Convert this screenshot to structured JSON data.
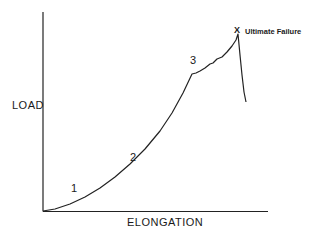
{
  "chart_data": {
    "type": "line",
    "title": "",
    "xlabel": "ELONGATION",
    "ylabel": "LOAD",
    "grid": false,
    "legend": null,
    "axis_ticks": "none",
    "series": [
      {
        "name": "Load-elongation curve",
        "points_px": [
          [
            43,
            211
          ],
          [
            55,
            209
          ],
          [
            70,
            204
          ],
          [
            85,
            197
          ],
          [
            100,
            188
          ],
          [
            115,
            177
          ],
          [
            130,
            164
          ],
          [
            145,
            149
          ],
          [
            160,
            131
          ],
          [
            172,
            113
          ],
          [
            183,
            93
          ],
          [
            192,
            74
          ],
          [
            196,
            73
          ],
          [
            200,
            71
          ],
          [
            205,
            68
          ],
          [
            210,
            64
          ],
          [
            213,
            63
          ],
          [
            217,
            59
          ],
          [
            222,
            57
          ],
          [
            227,
            52
          ],
          [
            232,
            46
          ],
          [
            236,
            40
          ],
          [
            238,
            34
          ],
          [
            240,
            55
          ],
          [
            242,
            75
          ],
          [
            244,
            92
          ],
          [
            246,
            102
          ]
        ]
      }
    ],
    "annotations": [
      {
        "text": "1",
        "region": "initial toe region"
      },
      {
        "text": "2",
        "region": "linear region"
      },
      {
        "text": "3",
        "region": "yield / microfailure region"
      },
      {
        "text": "X",
        "marker": "failure point"
      },
      {
        "text": "Ultimate Failure"
      }
    ]
  },
  "labels": {
    "y_axis": "LOAD",
    "x_axis": "ELONGATION",
    "region_1": "1",
    "region_2": "2",
    "region_3": "3",
    "failure_marker": "X",
    "failure_label": "Ultimate Failure"
  }
}
